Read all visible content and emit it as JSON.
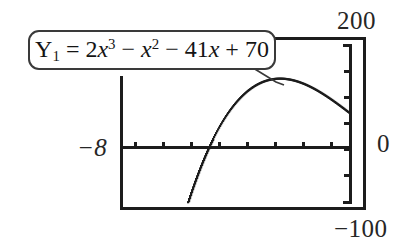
{
  "figure": {
    "kind": "graphing-calculator-screen",
    "background_color": "#ffffff",
    "ink_color": "#1c1c1c"
  },
  "callout": {
    "variable": "Y",
    "subscript": "1",
    "equals": "=",
    "term1_coeff": "2",
    "term1_var": "x",
    "term1_exp": "3",
    "op1": "−",
    "term2_var": "x",
    "term2_exp": "2",
    "op2": "−",
    "term3_coeff": "41",
    "term3_var": "x",
    "op3": "+",
    "term4": "70",
    "plain_text": "Y1 = 2x^3 - x^2 - 41x + 70"
  },
  "labels": {
    "y_max": "200",
    "y_min": "−100",
    "x_min": "−8",
    "x_max": "0"
  },
  "chart_data": {
    "type": "line",
    "title": "",
    "xlabel": "",
    "ylabel": "",
    "grid": false,
    "legend": "none",
    "annotations": [
      "Y1 = 2x^3 - x^2 - 41x + 70"
    ],
    "xlim": [
      -8,
      0
    ],
    "ylim": [
      -100,
      200
    ],
    "xtick_labels": [
      "−8",
      "0"
    ],
    "ytick_labels": [
      "200",
      "0",
      "−100"
    ],
    "x_axis_position": 0,
    "y_axis_position": 0,
    "expression": "y = 2x^3 - x^2 - 41x + 70",
    "series": [
      {
        "name": "Y1",
        "x": [
          -8.0,
          -7.75,
          -7.5,
          -7.25,
          -7.0,
          -6.75,
          -6.5,
          -6.25,
          -6.0,
          -5.75,
          -5.5,
          -5.25,
          -5.0,
          -4.75,
          -4.5,
          -4.25,
          -4.0,
          -3.75,
          -3.5,
          -3.25,
          -3.0,
          -2.75,
          -2.5,
          -2.25,
          -2.0,
          -1.75,
          -1.5,
          -1.25,
          -1.0,
          -0.75,
          -0.5,
          -0.25,
          0.0
        ],
        "y": [
          -698.0,
          -620.0,
          -546.0,
          -477.0,
          -412.0,
          -351.0,
          -294.0,
          -241.0,
          -193.0,
          -148.0,
          -108.0,
          -71.0,
          -39.0,
          -10.0,
          15.0,
          37.0,
          54.0,
          68.0,
          79.0,
          86.0,
          89.0,
          90.0,
          87.0,
          81.0,
          72.0,
          61.0,
          47.0,
          30.0,
          12.0,
          -9.0,
          -31.0,
          -55.0,
          70.0
        ],
        "visible_x_start": -6.3,
        "visible_x_end": 0.0,
        "x_intercept_visible": -5.0,
        "local_max_x": -2.7,
        "local_max_y": 90.0
      }
    ]
  },
  "axis_ticks": {
    "x_tick_count": 8,
    "y_tick_count": 5
  }
}
